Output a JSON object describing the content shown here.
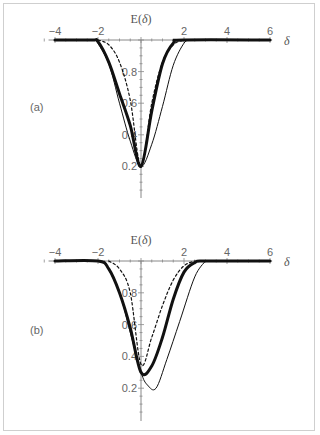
{
  "chart_data": [
    {
      "type": "line",
      "panel_label": "(a)",
      "title": "",
      "xlabel": "δ",
      "ylabel": "E(δ)",
      "xlim": [
        -4,
        6
      ],
      "ylim": [
        0,
        1
      ],
      "x_ticks": [
        "-4",
        "-2",
        "2",
        "4",
        "6"
      ],
      "y_ticks": [
        "0.2",
        "0.4",
        "0.6",
        "0.8"
      ],
      "grid": false,
      "series": [
        {
          "name": "thick",
          "style": "solid-thick",
          "points": [
            [
              -4,
              1
            ],
            [
              -2.3,
              1
            ],
            [
              -2,
              0.99
            ],
            [
              -1.5,
              0.86
            ],
            [
              -1,
              0.66
            ],
            [
              -0.5,
              0.46
            ],
            [
              0,
              0.2
            ],
            [
              0.5,
              0.55
            ],
            [
              1,
              0.85
            ],
            [
              1.5,
              0.98
            ],
            [
              2,
              1
            ],
            [
              6,
              1
            ]
          ]
        },
        {
          "name": "thin",
          "style": "solid-thin",
          "points": [
            [
              -2.1,
              1
            ],
            [
              -1.5,
              0.85
            ],
            [
              -1,
              0.6
            ],
            [
              -0.5,
              0.36
            ],
            [
              0,
              0.2
            ],
            [
              0.5,
              0.34
            ],
            [
              1,
              0.58
            ],
            [
              1.5,
              0.84
            ],
            [
              2,
              0.98
            ],
            [
              2.3,
              1
            ]
          ]
        },
        {
          "name": "dashed",
          "style": "dashed",
          "points": [
            [
              -2,
              1
            ],
            [
              -1.5,
              0.97
            ],
            [
              -1,
              0.86
            ],
            [
              -0.5,
              0.62
            ],
            [
              0,
              0.2
            ],
            [
              0.5,
              0.6
            ],
            [
              1,
              0.86
            ],
            [
              1.5,
              0.97
            ],
            [
              2,
              1
            ]
          ]
        }
      ]
    },
    {
      "type": "line",
      "panel_label": "(b)",
      "title": "",
      "xlabel": "δ",
      "ylabel": "E(δ)",
      "xlim": [
        -4,
        6
      ],
      "ylim": [
        0,
        1
      ],
      "x_ticks": [
        "-4",
        "-2",
        "2",
        "4",
        "6"
      ],
      "y_ticks": [
        "0.2",
        "0.4",
        "0.6",
        "0.8"
      ],
      "grid": false,
      "series": [
        {
          "name": "thick",
          "style": "solid-thick",
          "points": [
            [
              -4,
              1
            ],
            [
              -2,
              1
            ],
            [
              -1.5,
              0.95
            ],
            [
              -1,
              0.8
            ],
            [
              -0.5,
              0.58
            ],
            [
              0,
              0.3
            ],
            [
              0.5,
              0.34
            ],
            [
              1,
              0.52
            ],
            [
              1.5,
              0.76
            ],
            [
              2,
              0.93
            ],
            [
              2.5,
              0.99
            ],
            [
              3,
              1
            ],
            [
              6,
              1
            ]
          ]
        },
        {
          "name": "thin",
          "style": "solid-thin",
          "points": [
            [
              -1.7,
              1
            ],
            [
              -1,
              0.8
            ],
            [
              -0.5,
              0.55
            ],
            [
              0,
              0.3
            ],
            [
              0.3,
              0.22
            ],
            [
              0.7,
              0.2
            ],
            [
              1.2,
              0.38
            ],
            [
              1.8,
              0.62
            ],
            [
              2.5,
              0.9
            ],
            [
              3,
              1
            ]
          ]
        },
        {
          "name": "dashed",
          "style": "dashed",
          "points": [
            [
              -1.5,
              1
            ],
            [
              -1,
              0.95
            ],
            [
              -0.5,
              0.8
            ],
            [
              0,
              0.35
            ],
            [
              0.5,
              0.52
            ],
            [
              1,
              0.72
            ],
            [
              1.5,
              0.88
            ],
            [
              2,
              0.97
            ],
            [
              2.5,
              1
            ]
          ]
        }
      ]
    }
  ],
  "panels": {
    "a": {
      "label": "(a)",
      "ylabel": "E(δ)",
      "xlabel": "δ"
    },
    "b": {
      "label": "(b)",
      "ylabel": "E(δ)",
      "xlabel": "δ"
    }
  }
}
